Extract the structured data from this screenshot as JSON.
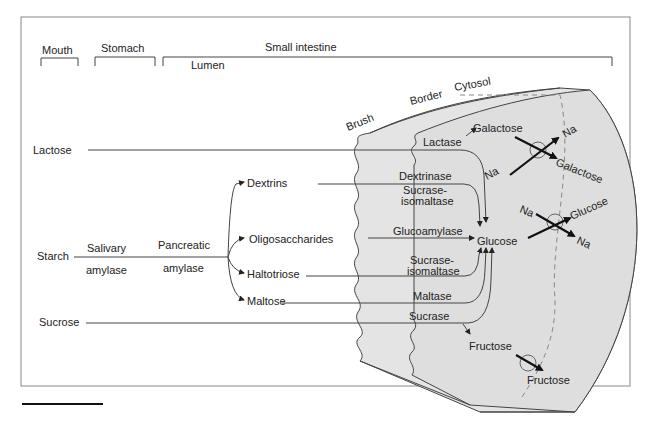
{
  "regions": {
    "mouth": "Mouth",
    "stomach": "Stomach",
    "small_intestine": "Small intestine",
    "lumen": "Lumen"
  },
  "cell_labels": {
    "brush": "Brush",
    "border": "Border",
    "cytosol": "Cytosol"
  },
  "substrates": {
    "lactose": "Lactose",
    "starch": "Starch",
    "sucrose": "Sucrose"
  },
  "digestive_enzymes": {
    "salivary_1": "Salivary",
    "salivary_2": "amylase",
    "pancreatic_1": "Pancreatic",
    "pancreatic_2": "amylase"
  },
  "intermediates": {
    "dextrins": "Dextrins",
    "oligosaccharides": "Oligosaccharides",
    "haltotriose": "Haltotriose",
    "maltose": "Maltose"
  },
  "brush_border_enzymes": {
    "lactase": "Lactase",
    "dextrinase": "Dextrinase",
    "sucrase_isomaltase_a1": "Sucrase-",
    "sucrase_isomaltase_a2": "isomaltase",
    "glucoamylase": "Glucoamylase",
    "sucrase_isomaltase_b1": "Sucrase-",
    "sucrase_isomaltase_b2": "isomaltase",
    "maltase": "Maltase",
    "sucrase": "Sucrase"
  },
  "products": {
    "galactose": "Galactose",
    "glucose": "Glucose",
    "fructose": "Fructose"
  },
  "transport": {
    "gal_na_in": "Na",
    "gal_na_out": "Na",
    "gal_out": "Galactose",
    "glu_na_in": "Na",
    "glu_na_out": "Na",
    "glu_out": "Glucose",
    "fru_out": "Fructose"
  },
  "colors": {
    "tissue_fill": "#e4e4e4",
    "line": "#444444",
    "text": "#222222",
    "frame": "#888888"
  }
}
